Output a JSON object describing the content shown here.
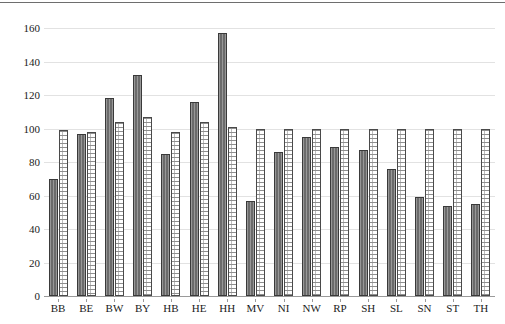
{
  "chart_data": {
    "type": "bar",
    "title": "",
    "subtitle": "",
    "xlabel": "",
    "ylabel": "",
    "ylim": [
      0,
      168
    ],
    "yticks": [
      0,
      20,
      40,
      60,
      80,
      100,
      120,
      140,
      160
    ],
    "grid": true,
    "legend_position": "none",
    "categories": [
      "BB",
      "BE",
      "BW",
      "BY",
      "HB",
      "HE",
      "HH",
      "MV",
      "NI",
      "NW",
      "RP",
      "SH",
      "SL",
      "SN",
      "ST",
      "TH"
    ],
    "series": [
      {
        "name": "series-1-dark",
        "color": "#6b6b6b",
        "values": [
          70,
          97,
          118,
          132,
          85,
          116,
          157,
          57,
          86,
          95,
          89,
          87,
          76,
          59,
          54,
          55
        ]
      },
      {
        "name": "series-2-light",
        "color": "#ffffff",
        "values": [
          99,
          98,
          104,
          107,
          98,
          104,
          101,
          100,
          100,
          100,
          100,
          100,
          100,
          100,
          100,
          100
        ]
      }
    ]
  },
  "axes": {
    "y_tick_labels": [
      "0",
      "20",
      "40",
      "60",
      "80",
      "100",
      "120",
      "140",
      "160"
    ],
    "x_tick_labels": [
      "BB",
      "BE",
      "BW",
      "BY",
      "HB",
      "HE",
      "HH",
      "MV",
      "NI",
      "NW",
      "RP",
      "SH",
      "SL",
      "SN",
      "ST",
      "TH"
    ]
  },
  "colors": {
    "bar_dark": "#6b6b6b",
    "bar_light": "#ffffff",
    "gridline": "#e2e2e2",
    "axis": "#9a9a9a",
    "text": "#1a1a1a",
    "top_rule": "#6e6e6e"
  }
}
